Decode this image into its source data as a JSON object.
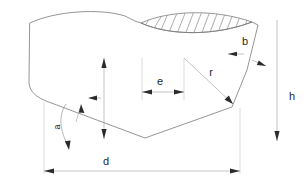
{
  "diagram": {
    "labels": {
      "width_bottom": "d",
      "height_right": "h",
      "offset_center": "e",
      "radius": "r",
      "thickness_right": "b",
      "thickness_left": "a"
    },
    "colors": {
      "outline": "#7a7a7a",
      "hatch": "#8a8a8a",
      "dimension": "#9a9a9a",
      "extension": "#b4b4b4",
      "arrow": "#2b2b2b",
      "text": "#1f1f1f",
      "background": "#ffffff"
    },
    "icon_names": {
      "arrow_left": "arrow-left-icon",
      "arrow_right": "arrow-right-icon",
      "arrow_up": "arrow-up-icon",
      "arrow_down": "arrow-down-icon"
    }
  }
}
